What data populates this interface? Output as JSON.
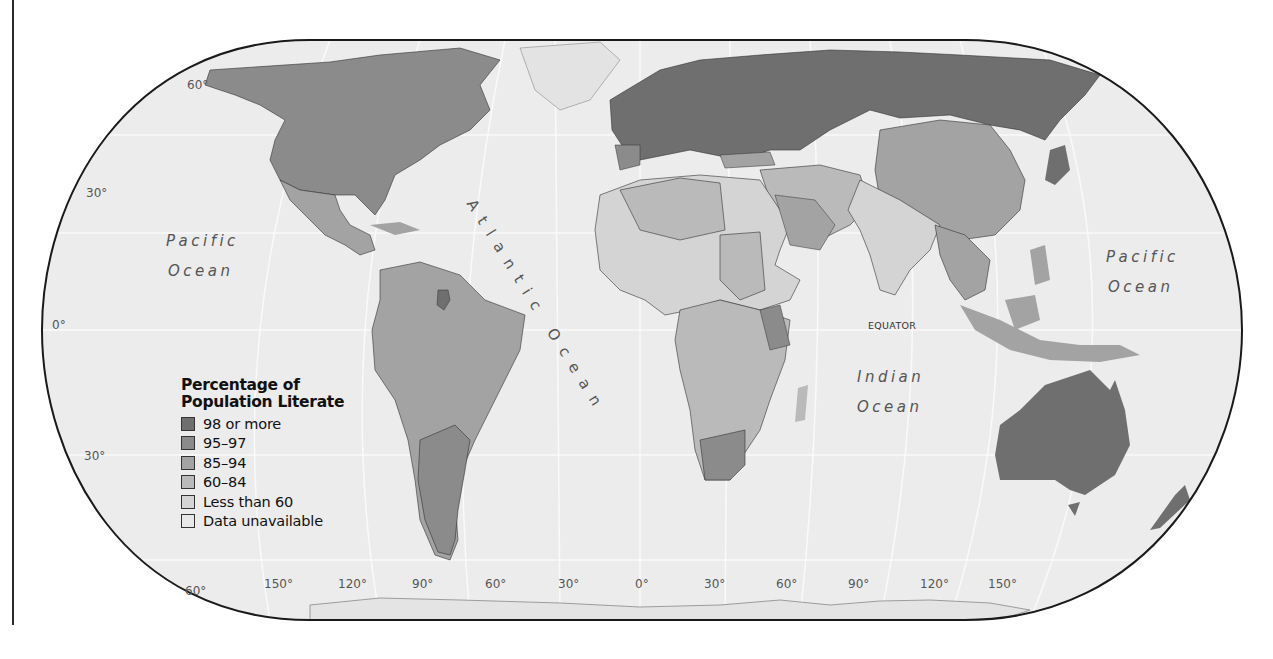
{
  "map": {
    "title": "Percentage of Population Literate",
    "legend": {
      "title_line1": "Percentage of",
      "title_line2": "Population Literate",
      "items": [
        {
          "label": "98 or more",
          "color": "#6f6f6f"
        },
        {
          "label": "95–97",
          "color": "#8b8b8b"
        },
        {
          "label": "85–94",
          "color": "#a3a3a3"
        },
        {
          "label": "60–84",
          "color": "#bababa"
        },
        {
          "label": "Less than 60",
          "color": "#d4d4d4"
        },
        {
          "label": "Data unavailable",
          "color": "#e8e8e8"
        }
      ]
    },
    "latitude_labels": {
      "lat60n": "60°",
      "lat30n": "30°",
      "lat0": "0°",
      "lat30s": "30°",
      "lat60s": "60°"
    },
    "longitude_labels": [
      "150°",
      "120°",
      "90°",
      "60°",
      "30°",
      "0°",
      "30°",
      "60°",
      "90°",
      "120°",
      "150°"
    ],
    "oceans": {
      "pacific_west_1": "Pacific",
      "pacific_west_2": "Ocean",
      "pacific_east_1": "Pacific",
      "pacific_east_2": "Ocean",
      "atlantic": "Atlantic Ocean",
      "indian_1": "Indian",
      "indian_2": "Ocean"
    },
    "equator_label": "EQUATOR",
    "colors": {
      "ocean": "#ececec",
      "outline": "#1a1a1a",
      "graticule": "#fafafa",
      "border": "#333333"
    }
  }
}
